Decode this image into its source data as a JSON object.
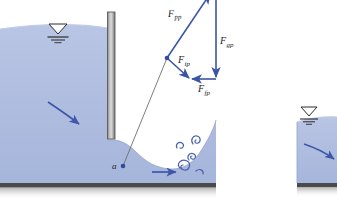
{
  "figure": {
    "name": "sluice-gate-hydraulic-jump-force-diagram",
    "background_color": "#ffffff"
  },
  "colors": {
    "water_fill": "#aebcdf",
    "water_fill_light": "#bcc8e5",
    "water_edge": "#9aa9d2",
    "vector_blue": "#3b55a6",
    "arrow_blue": "#3e57a8",
    "eddy_blue": "#4a62ad",
    "gate_dark": "#6f6f6f",
    "gate_light": "#d8d8d8",
    "ground_line": "#4a4a4a",
    "label_text": "#232323",
    "surface_symbol": "#2a2a2a"
  },
  "labels": {
    "force_pressure": {
      "main": "F",
      "sub": "pp"
    },
    "force_gravity": {
      "main": "F",
      "sub": "gp"
    },
    "force_inertia": {
      "main": "F",
      "sub": "ip"
    },
    "force_friction": {
      "main": "F",
      "sub": "fp"
    },
    "point_a": "a"
  },
  "elements": {
    "gate_name": "sluice-gate-plate",
    "upstream_pool": "upstream-water-body",
    "downstream_pool": "downstream-water-body",
    "ground": "channel-bed",
    "water_level_symbol_upstream": "water-surface-level-symbol",
    "water_level_symbol_downstream": "water-surface-level-symbol",
    "flow_arrow_upstream": "flow-direction-arrow",
    "flow_arrow_downstream": "flow-direction-arrow",
    "flow_arrow_right_tank": "flow-direction-arrow",
    "eddies": "turbulence-eddy-swirls",
    "streamline": "streamline-from-point-a",
    "force_polygon": "force-vector-polygon"
  }
}
